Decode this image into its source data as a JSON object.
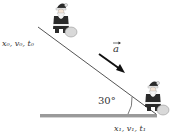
{
  "diagram": {
    "initial_label": "x₀, v₀, t₀",
    "final_label": "x₁, v₁, t₁",
    "acceleration_label": "a",
    "angle_label": "30°",
    "colors": {
      "line": "#555555",
      "ground": "#888888",
      "arrow": "#111111",
      "suit": "#2a2a2a",
      "beard": "#f2f2f2",
      "sack": "#d9d9d9"
    }
  }
}
